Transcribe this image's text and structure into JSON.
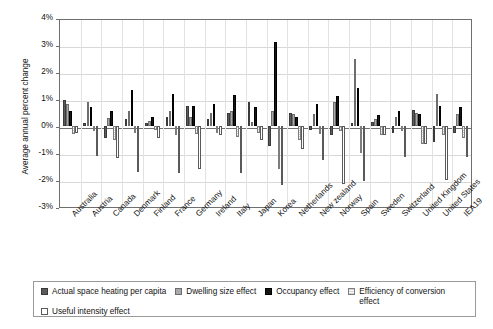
{
  "chart_data": {
    "type": "bar",
    "title": "",
    "xlabel": "",
    "ylabel": "Average annual percent change",
    "ylim": [
      -3,
      4
    ],
    "ytick_labels": [
      "4%",
      "3%",
      "2%",
      "1%",
      "0%",
      "-1%",
      "-2%",
      "-3%"
    ],
    "ytick_values": [
      4,
      3,
      2,
      1,
      0,
      -1,
      -2,
      -3
    ],
    "grid": true,
    "legend_position": "bottom",
    "categories": [
      "Australia",
      "Austria",
      "Canada",
      "Denmark",
      "Finland",
      "France",
      "Germany",
      "Ireland",
      "Italy",
      "Japan",
      "Korea",
      "Netherlands",
      "New zealand",
      "Norway",
      "Spain",
      "Sweden",
      "Switzerland",
      "United Kingdom",
      "United States",
      "IEA19"
    ],
    "series": [
      {
        "name": "Actual space heating per capita",
        "color": "#5b5b5b",
        "values": [
          0.95,
          0.1,
          -0.45,
          0.25,
          0.1,
          0.35,
          0.75,
          0.25,
          0.5,
          0.9,
          -0.75,
          0.5,
          -0.15,
          -0.35,
          0.1,
          0.15,
          -0.25,
          0.6,
          -0.6,
          -0.25
        ]
      },
      {
        "name": "Dwelling size effect",
        "color": "#a9a9a9",
        "values": [
          0.8,
          0.9,
          0.3,
          0.55,
          0.2,
          0.55,
          0.35,
          0.5,
          0.55,
          0.15,
          0.55,
          0.45,
          0.45,
          0.9,
          2.5,
          0.25,
          0.35,
          0.5,
          1.2,
          0.45
        ]
      },
      {
        "name": "Occupancy effect",
        "color": "#161616",
        "values": [
          0.55,
          0.7,
          0.55,
          1.35,
          0.35,
          1.2,
          0.75,
          0.8,
          1.15,
          0.7,
          3.1,
          0.35,
          0.8,
          1.1,
          1.4,
          0.4,
          0.55,
          0.45,
          0.75,
          0.7
        ]
      },
      {
        "name": "Efficiency of conversion effect",
        "color": "#cfcfcf",
        "values": [
          -0.3,
          -0.2,
          -0.5,
          -0.25,
          -0.15,
          -0.35,
          -0.3,
          -0.25,
          -0.4,
          -0.25,
          -1.6,
          -0.5,
          -0.3,
          -0.2,
          -1.0,
          -0.35,
          -0.2,
          -0.65,
          -0.35,
          -0.45
        ]
      },
      {
        "name": "Useful intensity effect",
        "color": "#ffffff",
        "values": [
          -0.25,
          -1.1,
          -1.2,
          -1.7,
          -0.45,
          -1.75,
          -1.6,
          -0.35,
          -1.75,
          -0.5,
          -2.2,
          -0.85,
          -1.25,
          -2.15,
          -2.05,
          -0.35,
          -1.15,
          -0.65,
          -2.0,
          -1.15
        ]
      }
    ]
  },
  "legend": {
    "items": [
      {
        "label": "Actual space heating per capita",
        "swatch": "dark-gray-swatch"
      },
      {
        "label": "Dwelling size effect",
        "swatch": "medium-gray-swatch"
      },
      {
        "label": "Occupancy effect",
        "swatch": "black-swatch"
      },
      {
        "label": "Efficiency of conversion effect",
        "swatch": "hatched-light-gray-swatch"
      },
      {
        "label": "Useful intensity effect",
        "swatch": "white-swatch"
      }
    ]
  }
}
